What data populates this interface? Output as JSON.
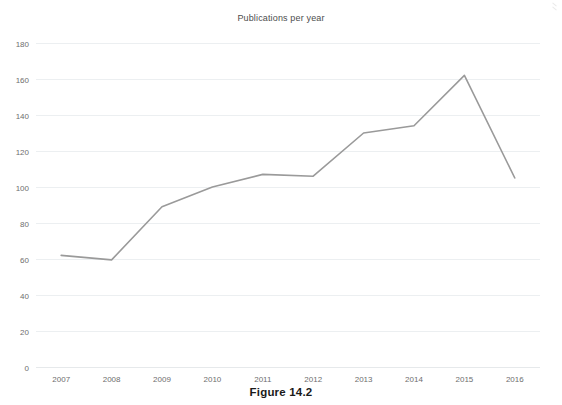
{
  "figure": {
    "caption": "Figure 14.2"
  },
  "chart_data": {
    "type": "line",
    "title": "Publications per year",
    "xlabel": "",
    "ylabel": "",
    "categories": [
      "2007",
      "2008",
      "2009",
      "2010",
      "2011",
      "2012",
      "2013",
      "2014",
      "2015",
      "2016"
    ],
    "values": [
      62,
      59.5,
      89,
      100,
      107,
      106,
      130,
      134,
      162,
      105
    ],
    "series": [
      {
        "name": "Publications per year",
        "values": [
          62,
          59.5,
          89,
          100,
          107,
          106,
          130,
          134,
          162,
          105
        ],
        "color": "#9a9a9a",
        "markers": false
      }
    ],
    "ylim": [
      0,
      180
    ],
    "ytick_step": 20,
    "yticks": [
      "0",
      "20",
      "40",
      "60",
      "80",
      "100",
      "120",
      "140",
      "160",
      "180"
    ],
    "xticks": [
      "2007",
      "2008",
      "2009",
      "2010",
      "2011",
      "2012",
      "2013",
      "2014",
      "2015",
      "2016"
    ],
    "grid": {
      "horizontal": true,
      "vertical": false,
      "color": "#eceff1"
    },
    "legend": {
      "visible": false,
      "position": "none"
    },
    "background": "#ffffff",
    "axis_line_color": "#e6e9eb"
  }
}
